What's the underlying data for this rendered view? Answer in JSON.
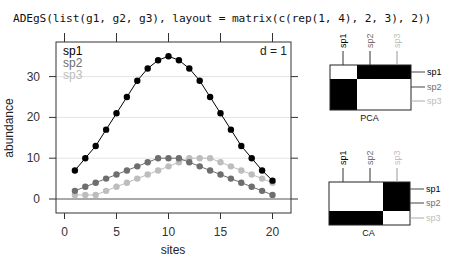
{
  "header": {
    "code": "ADEgS(list(g1, g2, g3), layout = matrix(c(rep(1, 4), 2, 3), 2))"
  },
  "colors": {
    "sp1": "#000000",
    "sp2": "#6e6e6e",
    "sp3": "#bdbdbd",
    "grid": "#e4e4e4",
    "frame": "#333333"
  },
  "main_plot": {
    "d_label": "d = 1",
    "xlabel": "sites",
    "ylabel": "abundance",
    "xticks": [
      "0",
      "5",
      "10",
      "15",
      "20"
    ],
    "yticks": [
      "0",
      "10",
      "20",
      "30"
    ],
    "legend": [
      "sp1",
      "sp2",
      "sp3"
    ]
  },
  "pca_panel": {
    "title": "PCA",
    "col_labels": [
      "sp1",
      "sp2",
      "sp3"
    ],
    "row_labels": [
      "sp1",
      "sp2",
      "sp3"
    ]
  },
  "ca_panel": {
    "title": "CA",
    "col_labels": [
      "sp1",
      "sp2",
      "sp3"
    ],
    "row_labels": [
      "sp1",
      "sp2",
      "sp3"
    ]
  },
  "chart_data": [
    {
      "type": "line",
      "title": "",
      "xlabel": "sites",
      "ylabel": "abundance",
      "x": [
        1,
        2,
        3,
        4,
        5,
        6,
        7,
        8,
        9,
        10,
        11,
        12,
        13,
        14,
        15,
        16,
        17,
        18,
        19,
        20
      ],
      "series": [
        {
          "name": "sp1",
          "values": [
            7,
            10,
            13,
            17,
            21,
            25,
            29,
            32,
            34,
            35,
            34,
            32,
            29,
            25,
            21,
            17,
            13,
            10,
            7,
            4.5
          ]
        },
        {
          "name": "sp2",
          "values": [
            2,
            3,
            4,
            5,
            6,
            7,
            8,
            9,
            10,
            10,
            10,
            9,
            8,
            7,
            6,
            5,
            4,
            3,
            2,
            1
          ]
        },
        {
          "name": "sp3",
          "values": [
            1,
            1,
            1,
            2,
            3,
            4,
            5,
            6,
            7,
            8,
            9,
            10,
            10,
            10,
            9,
            8,
            7,
            6,
            5,
            4
          ]
        }
      ],
      "xlim": [
        -1,
        22
      ],
      "ylim": [
        -3.5,
        38
      ],
      "grid": true,
      "legend_position": "top-left",
      "annotation": "d = 1"
    },
    {
      "type": "heatmap",
      "title": "PCA",
      "rows": [
        "sp1",
        "sp2",
        "sp3"
      ],
      "cols": [
        "sp1",
        "sp2",
        "sp3"
      ],
      "blocks": [
        {
          "rows": [
            "sp1"
          ],
          "cols": [
            "sp1"
          ],
          "fill": "white"
        },
        {
          "rows": [
            "sp1"
          ],
          "cols": [
            "sp2",
            "sp3"
          ],
          "fill": "black"
        },
        {
          "rows": [
            "sp2",
            "sp3"
          ],
          "cols": [
            "sp1"
          ],
          "fill": "black"
        },
        {
          "rows": [
            "sp2",
            "sp3"
          ],
          "cols": [
            "sp2",
            "sp3"
          ],
          "fill": "white"
        }
      ]
    },
    {
      "type": "heatmap",
      "title": "CA",
      "rows": [
        "sp1",
        "sp2",
        "sp3"
      ],
      "cols": [
        "sp1",
        "sp2",
        "sp3"
      ],
      "blocks": [
        {
          "rows": [
            "sp1",
            "sp2"
          ],
          "cols": [
            "sp1",
            "sp2"
          ],
          "fill": "white"
        },
        {
          "rows": [
            "sp1",
            "sp2"
          ],
          "cols": [
            "sp3"
          ],
          "fill": "black"
        },
        {
          "rows": [
            "sp3"
          ],
          "cols": [
            "sp1",
            "sp2"
          ],
          "fill": "black"
        },
        {
          "rows": [
            "sp3"
          ],
          "cols": [
            "sp3"
          ],
          "fill": "white"
        }
      ]
    }
  ]
}
